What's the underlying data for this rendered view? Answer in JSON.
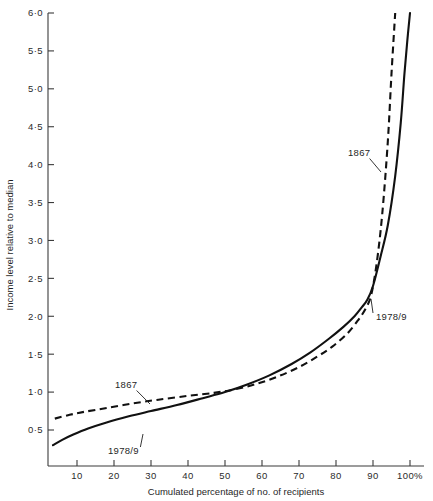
{
  "chart_data": {
    "type": "line",
    "title": "",
    "xlabel": "Cumulated percentage of no. of recipients",
    "ylabel": "Income level relative to median",
    "xlim": [
      3,
      102
    ],
    "ylim": [
      0.1,
      6.0
    ],
    "grid": false,
    "legend": "inline annotations",
    "x_ticks": [
      10,
      20,
      30,
      40,
      50,
      60,
      70,
      80,
      90,
      100
    ],
    "x_tick_labels": [
      "10",
      "20",
      "30",
      "40",
      "50",
      "60",
      "70",
      "80",
      "90",
      "100%"
    ],
    "y_ticks": [
      0.5,
      1.0,
      1.5,
      2.0,
      2.5,
      3.0,
      3.5,
      4.0,
      4.5,
      5.0,
      5.5,
      6.0
    ],
    "y_tick_labels": [
      "0·5",
      "1·0",
      "1·5",
      "2·0",
      "2·5",
      "3·0",
      "3·5",
      "4·0",
      "4·5",
      "5·0",
      "5·5",
      "6·0"
    ],
    "series": [
      {
        "name": "1867",
        "style": "dashed",
        "color": "#111111",
        "x": [
          4,
          8,
          12,
          18,
          25,
          32,
          40,
          47,
          52,
          58,
          64,
          70,
          75,
          79,
          83,
          86,
          88,
          89.5,
          91,
          92.5,
          94,
          95,
          96
        ],
        "values": [
          0.65,
          0.7,
          0.74,
          0.79,
          0.85,
          0.9,
          0.95,
          0.99,
          1.03,
          1.1,
          1.2,
          1.33,
          1.47,
          1.6,
          1.77,
          1.95,
          2.1,
          2.28,
          2.7,
          3.35,
          4.3,
          5.2,
          6.0
        ]
      },
      {
        "name": "1978/9",
        "style": "solid",
        "color": "#111111",
        "x": [
          3.5,
          6,
          9,
          13,
          18,
          24,
          30,
          37,
          44,
          50,
          56,
          62,
          68,
          73,
          78,
          82,
          85,
          87,
          88.5,
          90,
          92,
          94,
          96,
          97.5,
          98.5,
          99.3,
          100
        ],
        "values": [
          0.3,
          0.37,
          0.44,
          0.52,
          0.6,
          0.68,
          0.75,
          0.83,
          0.92,
          1.0,
          1.1,
          1.22,
          1.37,
          1.52,
          1.7,
          1.86,
          2.0,
          2.12,
          2.22,
          2.4,
          2.78,
          3.2,
          3.85,
          4.55,
          5.2,
          5.65,
          6.0
        ]
      }
    ],
    "annotations": [
      {
        "text": "1867",
        "x": 115,
        "y": 388,
        "leader_to_x": 150,
        "leader_to_y": 404
      },
      {
        "text": "1978/9",
        "x": 108,
        "y": 454,
        "leader_to_x": 143,
        "leader_to_y": 434
      },
      {
        "text": "1867",
        "x": 348,
        "y": 156,
        "leader_to_x": 381,
        "leader_to_y": 172
      },
      {
        "text": "1978/9",
        "x": 376,
        "y": 320,
        "leader_to_x": 371,
        "leader_to_y": 299
      }
    ]
  }
}
